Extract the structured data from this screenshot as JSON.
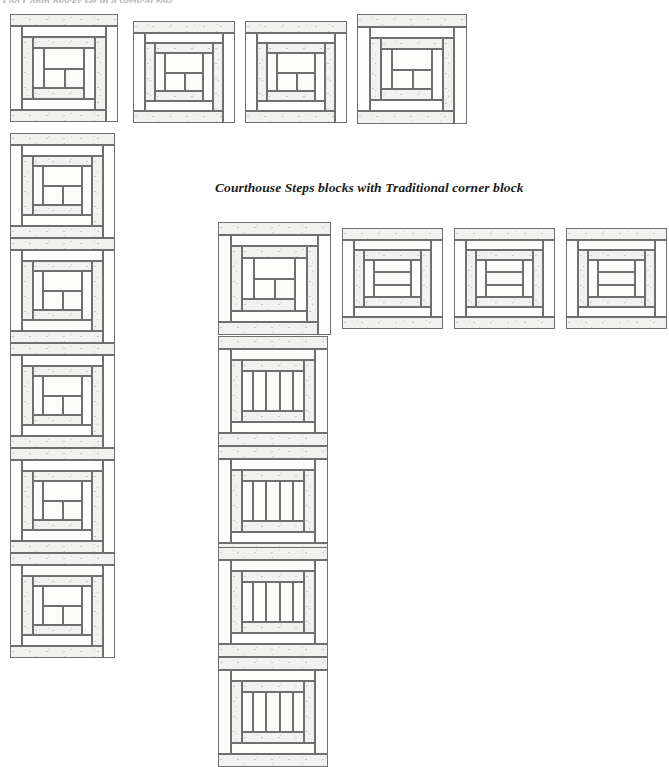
{
  "page": {
    "width": 669,
    "height": 759,
    "background": "#ffffff",
    "clipped_header_text": "Log Cabin blocks set in a vertical row"
  },
  "caption": {
    "text": "Courthouse Steps blocks with Traditional corner block",
    "x": 215,
    "y": 186,
    "font_size": 13.5,
    "color": "#1a1a1a",
    "style": "bold-italic-serif"
  },
  "colors": {
    "seam_line": "#6f6f6f",
    "fabric_light_speckled": "#f1f1ef",
    "fabric_plain": "#fdfdfc",
    "center_square": "#fbfbfa",
    "page_background": "#ffffff"
  },
  "legend": {
    "block_types": [
      {
        "name": "Traditional",
        "description": "Log Cabin block, logs spiral around an off-center square"
      },
      {
        "name": "Courthouse Steps",
        "description": "Logs added in opposite pairs, symmetric about the centre"
      }
    ]
  },
  "groups": [
    {
      "id": "top-left-group",
      "name": "Traditional Log Cabin L-shaped setting",
      "block_type": "Traditional",
      "row": {
        "y": 14,
        "blocks": [
          {
            "x": 10,
            "y": 14,
            "size": 108
          },
          {
            "x": 133,
            "y": 21,
            "size": 102
          },
          {
            "x": 245,
            "y": 21,
            "size": 102
          },
          {
            "x": 357,
            "y": 14,
            "size": 110
          }
        ]
      },
      "column": {
        "x": 10,
        "blocks": [
          {
            "x": 10,
            "y": 133,
            "size": 105
          },
          {
            "x": 10,
            "y": 238,
            "size": 105
          },
          {
            "x": 10,
            "y": 343,
            "size": 105
          },
          {
            "x": 10,
            "y": 448,
            "size": 105
          },
          {
            "x": 10,
            "y": 553,
            "size": 105
          }
        ]
      }
    },
    {
      "id": "bottom-right-group",
      "name": "Courthouse Steps L-shaped setting with Traditional corner",
      "corner_block_type": "Traditional",
      "block_type": "Courthouse Steps",
      "row": {
        "y": 222,
        "blocks": [
          {
            "x": 218,
            "y": 222,
            "size": 113,
            "type": "Traditional"
          },
          {
            "x": 342,
            "y": 228,
            "size": 101,
            "type": "Courthouse Steps"
          },
          {
            "x": 454,
            "y": 228,
            "size": 101,
            "type": "Courthouse Steps"
          },
          {
            "x": 566,
            "y": 228,
            "size": 101,
            "type": "Courthouse Steps"
          }
        ]
      },
      "column": {
        "x": 218,
        "blocks": [
          {
            "x": 218,
            "y": 336,
            "size": 110,
            "type": "Courthouse Steps"
          },
          {
            "x": 218,
            "y": 446,
            "size": 110,
            "type": "Courthouse Steps"
          },
          {
            "x": 218,
            "y": 547,
            "size": 110,
            "type": "Courthouse Steps"
          },
          {
            "x": 218,
            "y": 657,
            "size": 110,
            "type": "Courthouse Steps"
          }
        ]
      }
    }
  ],
  "counts": {
    "traditional_blocks": 10,
    "courthouse_steps_blocks": 7,
    "total_blocks": 17
  }
}
